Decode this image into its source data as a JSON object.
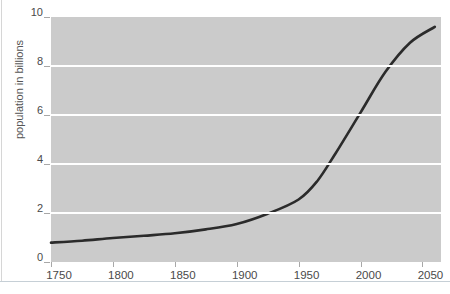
{
  "page": {
    "background": "#ffffff",
    "bottom_rule_color": "#c6cfd6",
    "left_edge_line_color": "#d6d6d6"
  },
  "chart_data": {
    "type": "line",
    "title": "",
    "xlabel": "",
    "ylabel": "population in billions",
    "x_ticks": [
      "1750",
      "1800",
      "1850",
      "1900",
      "1950",
      "2000",
      "2050"
    ],
    "x_tick_years": [
      1750,
      1800,
      1850,
      1900,
      1950,
      2000,
      2050
    ],
    "y_ticks": [
      0,
      2,
      4,
      6,
      8,
      10
    ],
    "y_gridline_values": [
      2,
      4,
      6,
      8
    ],
    "xlim": [
      1750,
      2065
    ],
    "ylim": [
      0,
      10
    ],
    "grid": "horizontal-only",
    "legend": "none",
    "plot_bg": "#cbcbcb",
    "gridline_color": "#ffffff",
    "series": [
      {
        "name": "world-population",
        "color": "#2b2b2b",
        "points": [
          [
            1750,
            0.79
          ],
          [
            1775,
            0.87
          ],
          [
            1800,
            0.98
          ],
          [
            1825,
            1.07
          ],
          [
            1850,
            1.17
          ],
          [
            1875,
            1.33
          ],
          [
            1900,
            1.55
          ],
          [
            1925,
            1.97
          ],
          [
            1950,
            2.55
          ],
          [
            1965,
            3.3
          ],
          [
            1980,
            4.45
          ],
          [
            2000,
            6.1
          ],
          [
            2020,
            7.75
          ],
          [
            2040,
            8.95
          ],
          [
            2060,
            9.6
          ]
        ]
      }
    ]
  }
}
